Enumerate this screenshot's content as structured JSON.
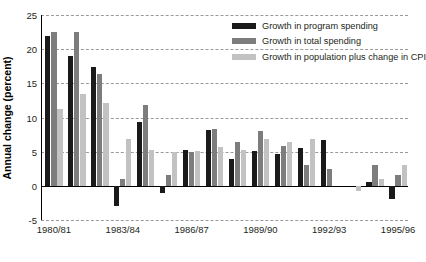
{
  "chart_data": {
    "type": "bar",
    "title": "",
    "subtitle": "",
    "xlabel": "",
    "ylabel": "Annual change (percent)",
    "ylim": [
      -5,
      25
    ],
    "yticks": [
      25,
      20,
      15,
      10,
      5,
      0,
      -5
    ],
    "ytick_labels": [
      "25",
      "20",
      "15",
      "10",
      "5",
      "0",
      "-5"
    ],
    "grid": true,
    "legend_position": "top-right",
    "categories": [
      "1980/81",
      "1981/82",
      "1982/83",
      "1983/84",
      "1984/85",
      "1985/86",
      "1986/87",
      "1987/88",
      "1988/89",
      "1989/90",
      "1990/91",
      "1991/92",
      "1992/93",
      "1993/94",
      "1994/95",
      "1995/96"
    ],
    "xtick_labels": [
      "1980/81",
      "1983/84",
      "1986/87",
      "1989/90",
      "1992/93",
      "1995/96"
    ],
    "xtick_indices": [
      0,
      3,
      6,
      9,
      12,
      15
    ],
    "series": [
      {
        "name": "Growth in program spending",
        "color": "#1a1a1a",
        "values": [
          22.0,
          19.0,
          17.4,
          -3.0,
          9.3,
          -1.1,
          5.3,
          8.1,
          4.0,
          5.1,
          4.6,
          5.5,
          6.7,
          0.0,
          0.6,
          -2.0
        ]
      },
      {
        "name": "Growth in total spending",
        "color": "#7d7d7d",
        "values": [
          22.5,
          22.5,
          16.4,
          1.0,
          11.8,
          1.6,
          4.9,
          8.3,
          6.4,
          8.0,
          5.9,
          3.0,
          2.5,
          0.0,
          3.0,
          1.6
        ]
      },
      {
        "name": "Growth in population plus change in CPI",
        "color": "#c2c2c2",
        "values": [
          11.3,
          13.5,
          12.1,
          6.8,
          5.2,
          4.9,
          5.1,
          5.7,
          5.3,
          6.8,
          6.4,
          6.8,
          0.0,
          -0.8,
          1.0,
          3.1
        ]
      }
    ]
  }
}
